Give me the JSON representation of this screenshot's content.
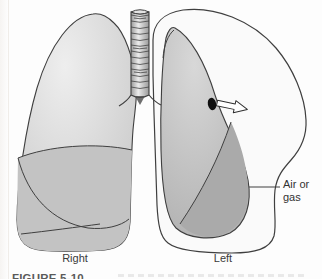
{
  "figure": {
    "caption_label": "FIGURE 5-10",
    "labels": {
      "right_lung": "Right",
      "left_lung": "Left",
      "annotation": "Air or gas"
    },
    "colors": {
      "background": "#fdfdfd",
      "outline": "#3f3f3f",
      "right_lung_highlight": "#eeeeee",
      "right_lung_base": "#c7c7c7",
      "right_lung_lower_lobe": "#c3c3c3",
      "left_lung_highlight": "#d8d8d8",
      "left_lung_base": "#b3b3b3",
      "left_lung_lower_lobe": "#aaaaaa",
      "pleural_space": "#fafafa",
      "trachea_light": "#ececec",
      "trachea_dark": "#9a9a9a",
      "hole": "#101010",
      "arrow_fill": "#ffffff",
      "label_text": "#3a3a3a",
      "caption_text": "#5a5a5a"
    }
  }
}
